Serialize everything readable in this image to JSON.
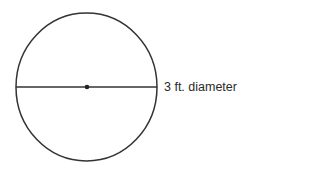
{
  "diagram": {
    "shape": "circle",
    "label": "3 ft. diameter",
    "stroke_color": "#333333",
    "background": "#ffffff"
  }
}
